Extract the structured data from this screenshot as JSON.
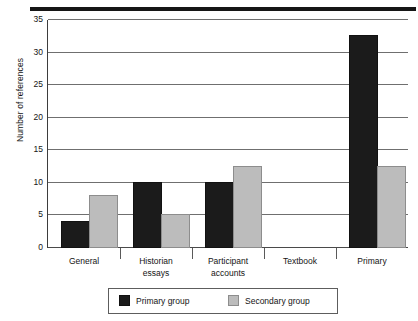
{
  "chart_data": {
    "type": "bar",
    "title": "",
    "xlabel": "",
    "ylabel": "Number of references",
    "ylim": [
      0,
      35
    ],
    "ytick_step": 5,
    "yticks": [
      0,
      5,
      10,
      15,
      20,
      25,
      30,
      35
    ],
    "grid": true,
    "legend_position": "bottom",
    "categories": [
      "General",
      "Historian essays",
      "Participant accounts",
      "Textbook",
      "Primary"
    ],
    "category_lines": [
      [
        "General"
      ],
      [
        "Historian",
        "essays"
      ],
      [
        "Participant",
        "accounts"
      ],
      [
        "Textbook"
      ],
      [
        "Primary"
      ]
    ],
    "series": [
      {
        "name": "Primary group",
        "color": "#1b1b1b",
        "values": [
          4,
          10,
          10,
          0,
          32.5
        ]
      },
      {
        "name": "Secondary group",
        "color": "#bcbcbc",
        "values": [
          8,
          5,
          12.5,
          0,
          12.5
        ]
      }
    ]
  },
  "legend": {
    "entries": [
      {
        "label": "Primary group",
        "swatch": "primary"
      },
      {
        "label": "Secondary group",
        "swatch": "secondary"
      }
    ]
  }
}
